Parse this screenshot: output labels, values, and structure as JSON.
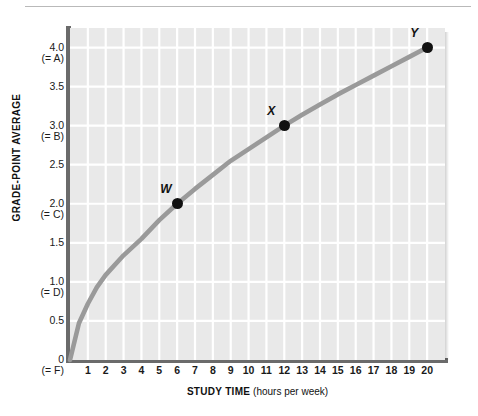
{
  "figure": {
    "background_color": "#ffffff",
    "plot_background_color": "#e9e9e9",
    "gridline_color": "#ffffff",
    "axis_color": "#6b6b6b",
    "curve_color": "#9a9a9a",
    "point_color": "#111111"
  },
  "axes": {
    "y": {
      "title": "GRADE-POINT AVERAGE",
      "min": 0,
      "max": 4.25,
      "ticks": [
        {
          "value": 4.0,
          "label": "4.0",
          "grade": "(= A)"
        },
        {
          "value": 3.5,
          "label": "3.5",
          "grade": ""
        },
        {
          "value": 3.0,
          "label": "3.0",
          "grade": "(= B)"
        },
        {
          "value": 2.5,
          "label": "2.5",
          "grade": ""
        },
        {
          "value": 2.0,
          "label": "2.0",
          "grade": "(= C)"
        },
        {
          "value": 1.5,
          "label": "1.5",
          "grade": ""
        },
        {
          "value": 1.0,
          "label": "1.0",
          "grade": "(= D)"
        },
        {
          "value": 0.5,
          "label": "0.5",
          "grade": ""
        },
        {
          "value": 0.0,
          "label": "0",
          "grade": "(= F)"
        }
      ]
    },
    "x": {
      "title_strong": "STUDY TIME",
      "title_unit": "(hours per week)",
      "min": 0,
      "max": 21,
      "ticks": [
        {
          "value": 1,
          "label": "1"
        },
        {
          "value": 2,
          "label": "2"
        },
        {
          "value": 3,
          "label": "3"
        },
        {
          "value": 4,
          "label": "4"
        },
        {
          "value": 5,
          "label": "5"
        },
        {
          "value": 6,
          "label": "6"
        },
        {
          "value": 7,
          "label": "7"
        },
        {
          "value": 8,
          "label": "8"
        },
        {
          "value": 9,
          "label": "9"
        },
        {
          "value": 10,
          "label": "10"
        },
        {
          "value": 11,
          "label": "11"
        },
        {
          "value": 12,
          "label": "12"
        },
        {
          "value": 13,
          "label": "13"
        },
        {
          "value": 14,
          "label": "14"
        },
        {
          "value": 15,
          "label": "15"
        },
        {
          "value": 16,
          "label": "16"
        },
        {
          "value": 17,
          "label": "17"
        },
        {
          "value": 18,
          "label": "18"
        },
        {
          "value": 19,
          "label": "19"
        },
        {
          "value": 20,
          "label": "20"
        }
      ]
    }
  },
  "chart_data": {
    "type": "line",
    "title": "",
    "subtitle": "",
    "xlabel": "STUDY TIME (hours per week)",
    "ylabel": "GRADE-POINT AVERAGE",
    "xlim": [
      0,
      21
    ],
    "ylim": [
      0,
      4.25
    ],
    "grid": true,
    "legend_position": "none",
    "xticks": [
      1,
      2,
      3,
      4,
      5,
      6,
      7,
      8,
      9,
      10,
      11,
      12,
      13,
      14,
      15,
      16,
      17,
      18,
      19,
      20
    ],
    "yticks": [
      0,
      0.5,
      1.0,
      1.5,
      2.0,
      2.5,
      3.0,
      3.5,
      4.0
    ],
    "ytick_labels": [
      "0 (= F)",
      "0.5",
      "1.0 (= D)",
      "1.5",
      "2.0 (= C)",
      "2.5",
      "3.0 (= B)",
      "3.5",
      "4.0 (= A)"
    ],
    "series": [
      {
        "name": "Grade-point average vs. study time",
        "color": "#9a9a9a",
        "x": [
          0,
          0.5,
          1,
          1.5,
          2,
          3,
          4,
          5,
          6,
          7,
          8,
          9,
          10,
          11,
          12,
          13,
          14,
          15,
          16,
          17,
          18,
          19,
          20
        ],
        "y": [
          0.0,
          0.47,
          0.72,
          0.93,
          1.09,
          1.34,
          1.55,
          1.79,
          2.0,
          2.19,
          2.37,
          2.55,
          2.7,
          2.85,
          3.0,
          3.14,
          3.27,
          3.4,
          3.52,
          3.64,
          3.76,
          3.88,
          4.0
        ]
      }
    ],
    "annotations": [
      {
        "label": "W",
        "x": 6,
        "y": 2.0
      },
      {
        "label": "X",
        "x": 12,
        "y": 3.0
      },
      {
        "label": "Y",
        "x": 20,
        "y": 4.0
      }
    ]
  }
}
